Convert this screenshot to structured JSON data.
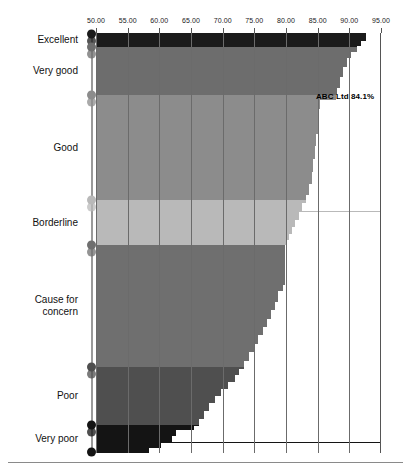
{
  "chart_data": {
    "type": "bar",
    "title": "",
    "subtitle": "",
    "xlabel": "",
    "ylabel": "",
    "orientation": "horizontal",
    "grid": true,
    "legend_position": "none",
    "xlim": [
      50,
      95
    ],
    "xticks": [
      "50.00",
      "55.00",
      "60.00",
      "65.00",
      "70.00",
      "75.00",
      "80.00",
      "85.00",
      "90.00",
      "95.00"
    ],
    "xtick_values": [
      50,
      55,
      60,
      65,
      70,
      75,
      80,
      85,
      90,
      95
    ],
    "categories": [
      "Excellent",
      "Very good",
      "Good",
      "Borderline",
      "Cause for concern",
      "Poor",
      "Very poor"
    ],
    "band_extents": [
      {
        "name": "Excellent",
        "y_from": 0.0,
        "y_to": 14.0,
        "color": "#1b1b1b",
        "max_value": 92.6
      },
      {
        "name": "Very good",
        "y_from": 14.0,
        "y_to": 62.0,
        "color": "#6d6d6d",
        "max_value": 88.8
      },
      {
        "name": "Good",
        "y_from": 62.0,
        "y_to": 167.0,
        "color": "#8c8c8c",
        "max_value": 84.1
      },
      {
        "name": "Borderline",
        "y_from": 167.0,
        "y_to": 212.0,
        "color": "#b9b9b9",
        "max_value": 79.8
      },
      {
        "name": "Cause for concern",
        "y_from": 212.0,
        "y_to": 334.0,
        "color": "#6f6f6f",
        "max_value": 78.7
      },
      {
        "name": "Poor",
        "y_from": 334.0,
        "y_to": 392.0,
        "color": "#4f4f4f",
        "max_value": 72.0
      },
      {
        "name": "Very poor",
        "y_from": 392.0,
        "y_to": 420.0,
        "color": "#141414",
        "max_value": 65.5
      }
    ],
    "profile_note": "Cumulative descending staircase: value falls monotonically from ~92.6 at the top (Excellent) to ~56 at the bottom (Very poor).",
    "profile": [
      {
        "t": 0.0,
        "value": 92.6
      },
      {
        "t": 0.012,
        "value": 92.6
      },
      {
        "t": 0.02,
        "value": 91.9
      },
      {
        "t": 0.031,
        "value": 91.2
      },
      {
        "t": 0.045,
        "value": 90.3
      },
      {
        "t": 0.06,
        "value": 89.6
      },
      {
        "t": 0.08,
        "value": 89.0
      },
      {
        "t": 0.105,
        "value": 88.6
      },
      {
        "t": 0.13,
        "value": 88.1
      },
      {
        "t": 0.148,
        "value": 87.9
      },
      {
        "t": 0.16,
        "value": 85.4
      },
      {
        "t": 0.18,
        "value": 85.2
      },
      {
        "t": 0.21,
        "value": 85.0
      },
      {
        "t": 0.24,
        "value": 84.8
      },
      {
        "t": 0.27,
        "value": 84.6
      },
      {
        "t": 0.3,
        "value": 84.3
      },
      {
        "t": 0.33,
        "value": 84.1
      },
      {
        "t": 0.36,
        "value": 83.7
      },
      {
        "t": 0.385,
        "value": 83.2
      },
      {
        "t": 0.405,
        "value": 82.6
      },
      {
        "t": 0.425,
        "value": 82.0
      },
      {
        "t": 0.445,
        "value": 81.4
      },
      {
        "t": 0.462,
        "value": 80.9
      },
      {
        "t": 0.478,
        "value": 80.4
      },
      {
        "t": 0.492,
        "value": 80.0
      },
      {
        "t": 0.505,
        "value": 79.8
      },
      {
        "t": 0.53,
        "value": 79.8
      },
      {
        "t": 0.56,
        "value": 79.8
      },
      {
        "t": 0.58,
        "value": 79.8
      },
      {
        "t": 0.6,
        "value": 79.6
      },
      {
        "t": 0.615,
        "value": 78.7
      },
      {
        "t": 0.64,
        "value": 78.2
      },
      {
        "t": 0.66,
        "value": 77.6
      },
      {
        "t": 0.68,
        "value": 77.0
      },
      {
        "t": 0.7,
        "value": 76.3
      },
      {
        "t": 0.72,
        "value": 75.6
      },
      {
        "t": 0.74,
        "value": 74.9
      },
      {
        "t": 0.76,
        "value": 74.2
      },
      {
        "t": 0.78,
        "value": 73.4
      },
      {
        "t": 0.8,
        "value": 72.6
      },
      {
        "t": 0.815,
        "value": 72.0
      },
      {
        "t": 0.83,
        "value": 70.9
      },
      {
        "t": 0.848,
        "value": 69.8
      },
      {
        "t": 0.865,
        "value": 68.8
      },
      {
        "t": 0.882,
        "value": 67.9
      },
      {
        "t": 0.9,
        "value": 67.0
      },
      {
        "t": 0.918,
        "value": 66.3
      },
      {
        "t": 0.935,
        "value": 65.5
      },
      {
        "t": 0.945,
        "value": 62.6
      },
      {
        "t": 0.96,
        "value": 62.0
      },
      {
        "t": 0.975,
        "value": 60.2
      },
      {
        "t": 0.988,
        "value": 58.4
      },
      {
        "t": 1.0,
        "value": 56.2
      }
    ],
    "annotation": {
      "label": "ABC Ltd 84.1%",
      "value": 84.1,
      "company": "ABC Ltd"
    }
  },
  "axis": {
    "tick_labels": [
      "50.00",
      "55.00",
      "60.00",
      "65.00",
      "70.00",
      "75.00",
      "80.00",
      "85.00",
      "90.00",
      "95.00"
    ]
  },
  "categories": {
    "items": [
      {
        "label": "Excellent",
        "color": "#1b1b1b"
      },
      {
        "label": "Very good",
        "color": "#6d6d6d"
      },
      {
        "label": "Good",
        "color": "#8c8c8c"
      },
      {
        "label": "Borderline",
        "color": "#b9b9b9"
      },
      {
        "label": "Cause for\nconcern",
        "color": "#6f6f6f"
      },
      {
        "label": "Poor",
        "color": "#4f4f4f"
      },
      {
        "label": "Very poor",
        "color": "#141414"
      }
    ]
  },
  "annotation": {
    "text": "ABC Ltd 84.1%"
  },
  "colors": {
    "excellent": "#1b1b1b",
    "very_good": "#6d6d6d",
    "good": "#8c8c8c",
    "borderline": "#b9b9b9",
    "cause_for_concern": "#6f6f6f",
    "poor": "#4f4f4f",
    "very_poor": "#141414",
    "gridline": "#6b6b6b",
    "spine": "#9a9a9a",
    "background": "#ffffff",
    "text": "#111111"
  }
}
